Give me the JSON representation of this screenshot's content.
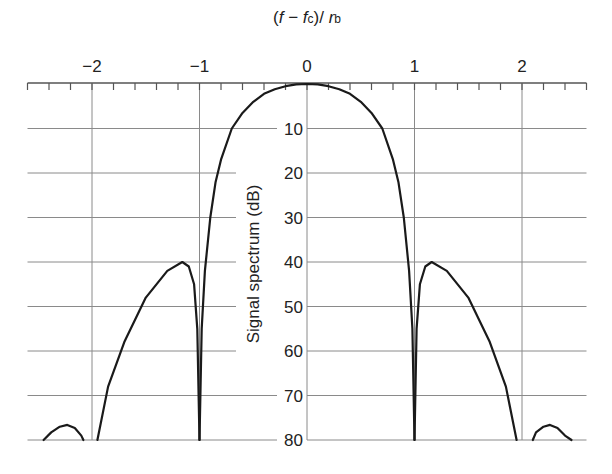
{
  "chart_data": {
    "type": "line",
    "title": "",
    "xlabel": "(f − fc)/ rb",
    "xlabel_parts": {
      "open": "(",
      "f": "f",
      "minus": " − ",
      "fc": "f",
      "fc_sub": "c",
      "close": ")/ ",
      "rb": "r",
      "rb_sub": "b"
    },
    "ylabel": "Signal spectrum (dB)",
    "xlim": [
      -2.6,
      2.6
    ],
    "ylim": [
      0,
      80
    ],
    "y_inverted": true,
    "grid": true,
    "x_ticks_major": [
      -2,
      -1,
      0,
      1,
      2
    ],
    "x_tick_labels": [
      "−2",
      "−1",
      "0",
      "1",
      "2"
    ],
    "x_ticks_minor_step": 0.2,
    "y_ticks": [
      10,
      20,
      30,
      40,
      50,
      60,
      70,
      80
    ],
    "y_tick_labels": [
      "10",
      "20",
      "30",
      "40",
      "50",
      "60",
      "70",
      "80"
    ],
    "series": [
      {
        "name": "spectrum",
        "segments": [
          {
            "x": [
              -2.45,
              -2.38,
              -2.3,
              -2.23,
              -2.16,
              -2.1,
              -2.08
            ],
            "y": [
              80,
              78.3,
              77.0,
              76.6,
              77.3,
              79.0,
              80
            ]
          },
          {
            "x": [
              -1.95,
              -1.85,
              -1.7,
              -1.5,
              -1.3,
              -1.16,
              -1.1,
              -1.05,
              -1.02,
              -1.0
            ],
            "y": [
              80,
              68,
              58,
              48,
              42,
              40,
              41,
              45,
              55,
              80
            ]
          },
          {
            "x": [
              -1.0,
              -0.98,
              -0.95,
              -0.9,
              -0.85,
              -0.8,
              -0.7,
              -0.6,
              -0.5,
              -0.4,
              -0.3,
              -0.2,
              -0.1,
              0,
              0.1,
              0.2,
              0.3,
              0.4,
              0.5,
              0.6,
              0.7,
              0.8,
              0.85,
              0.9,
              0.95,
              0.98,
              1.0
            ],
            "y": [
              80,
              55,
              42,
              30,
              22,
              17,
              10,
              6.5,
              4,
              2.2,
              1.2,
              0.5,
              0.1,
              0,
              0.1,
              0.5,
              1.2,
              2.2,
              4,
              6.5,
              10,
              17,
              22,
              30,
              42,
              55,
              80
            ]
          },
          {
            "x": [
              1.0,
              1.02,
              1.05,
              1.1,
              1.16,
              1.3,
              1.5,
              1.7,
              1.85,
              1.95
            ],
            "y": [
              80,
              55,
              45,
              41,
              40,
              42,
              48,
              58,
              68,
              80
            ]
          },
          {
            "x": [
              2.1,
              2.13,
              2.2,
              2.26,
              2.33,
              2.4,
              2.46
            ],
            "y": [
              80,
              78.3,
              77.0,
              76.6,
              77.3,
              79.0,
              80
            ]
          }
        ]
      }
    ],
    "colors": {
      "curve": "#1a1a1a",
      "grid": "#8a8a8a",
      "axis": "#555555",
      "text": "#222222"
    }
  }
}
